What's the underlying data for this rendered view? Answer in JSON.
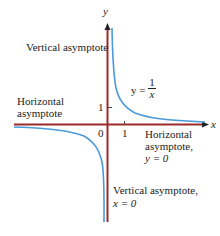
{
  "diagram": {
    "colors": {
      "axis": "#9b2b2b",
      "curve": "#4a9ad8",
      "text": "#222222"
    },
    "axes": {
      "x_label": "x",
      "y_label": "y",
      "origin_label": "0",
      "x_tick_label": "1",
      "y_tick_label": "1"
    },
    "function_label": {
      "lhs": "y =",
      "numerator": "1",
      "denominator": "x"
    },
    "annotations": {
      "vertical_top": "Vertical asymptote",
      "horizontal_left_1": "Horizontal",
      "horizontal_left_2": "asymptote",
      "horizontal_right_1": "Horizontal",
      "horizontal_right_2": "asymptote,",
      "horizontal_right_3": "y = 0",
      "vertical_bottom_1": "Vertical asymptote,",
      "vertical_bottom_2": "x = 0"
    }
  }
}
